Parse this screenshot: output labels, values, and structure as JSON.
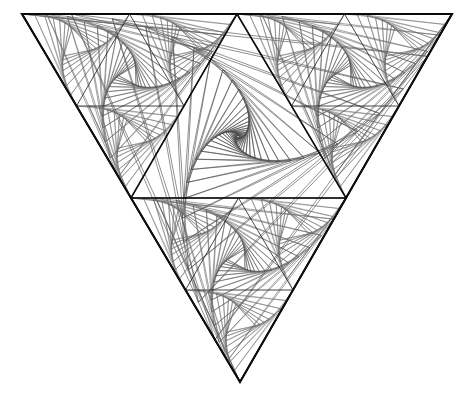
{
  "figure": {
    "type": "geometric-line-figure",
    "background_color": "#ffffff",
    "canvas": {
      "width": 471,
      "height": 399
    }
  },
  "style": {
    "outline_color": "#000000",
    "outline_width": 2.0,
    "spiral_color": "#4d4d4d",
    "spiral_width": 0.62,
    "sub_outline_color": "#000000",
    "sub_outline_width": 1.6,
    "sub_spiral_color": "#5a5a5a",
    "sub_spiral_width": 0.55,
    "leaf_outline_color": "#1a1a1a",
    "leaf_outline_width": 0.8,
    "leaf_spiral_color": "#6a6a6a",
    "leaf_spiral_width": 0.5,
    "fill": "none",
    "linecap": "butt",
    "linejoin": "miter"
  },
  "geometry": {
    "main_triangle": {
      "name": "outer-inverted-triangle",
      "orientation": "point-down",
      "vertices": [
        {
          "label": "top-left",
          "x": 22,
          "y": 14
        },
        {
          "label": "top-right",
          "x": 452,
          "y": 14
        },
        {
          "label": "bottom",
          "x": 240,
          "y": 382
        }
      ],
      "edge_lengths": {
        "top": 430,
        "left": 425,
        "right": 425
      }
    },
    "recursion": {
      "max_depth": 2,
      "children_per_node": 3,
      "child_placement": "midpoint-subdivision",
      "child_labels": [
        "left",
        "right",
        "bottom"
      ]
    },
    "spiral": {
      "description": "Each triangle is filled with a sequence of inscribed triangles; each successive triangle's vertices sit at a constant ratio along the edges of the previous one, producing an inward rotating spiral that leaves an open region at the center.",
      "iterations_depth0": 26,
      "iterations_depth1": 13,
      "iterations_depth2": 7,
      "step_ratio": 0.115,
      "direction": "clockwise",
      "connect_vertices": true
    }
  },
  "chart_data": {
    "type": "line",
    "subtitle": "",
    "xlabel": "",
    "ylabel": "",
    "grid": false,
    "legend": "none",
    "xlim": [
      0,
      471
    ],
    "ylim": [
      399,
      0
    ],
    "series": [
      {
        "name": "outer-triangle",
        "closed": true,
        "x": [
          22,
          452,
          240
        ],
        "y": [
          14,
          14,
          382
        ]
      },
      {
        "name": "left-subtriangle",
        "closed": true,
        "x": [
          22,
          237,
          131
        ],
        "y": [
          14,
          14,
          198
        ]
      },
      {
        "name": "right-subtriangle",
        "closed": true,
        "x": [
          237,
          452,
          346
        ],
        "y": [
          14,
          14,
          198
        ]
      },
      {
        "name": "bottom-subtriangle",
        "closed": true,
        "x": [
          131,
          346,
          240
        ],
        "y": [
          198,
          198,
          382
        ]
      }
    ],
    "annotations": []
  }
}
